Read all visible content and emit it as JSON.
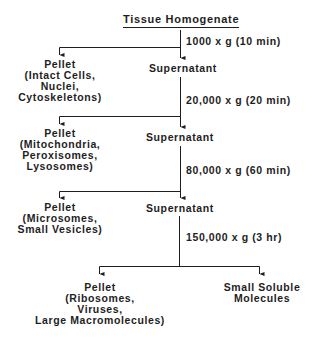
{
  "title": "Tissue Homogenate",
  "steps": [
    {
      "condition": "1000 x g (10 min)",
      "pellet": [
        "Pellet",
        "(Intact Cells,",
        "Nuclei,",
        "Cytoskeletons)"
      ],
      "supernatant": "Supernatant"
    },
    {
      "condition": "20,000 x g (20 min)",
      "pellet": [
        "Pellet",
        "(Mitochondria,",
        "Peroxisomes,",
        "Lysosomes)"
      ],
      "supernatant": "Supernatant"
    },
    {
      "condition": "80,000 x g (60 min)",
      "pellet": [
        "Pellet",
        "(Microsomes,",
        "Small Vesicles)"
      ],
      "supernatant": "Supernatant"
    },
    {
      "condition": "150,000 x g (3 hr)",
      "pellet": [
        "Pellet",
        "(Ribosomes,",
        "Viruses,",
        "Large Macromolecules)"
      ],
      "supernatant": [
        "Small Soluble",
        "Molecules"
      ]
    }
  ],
  "colors": {
    "ink": "#1e1e1e",
    "background": "#ffffff"
  }
}
